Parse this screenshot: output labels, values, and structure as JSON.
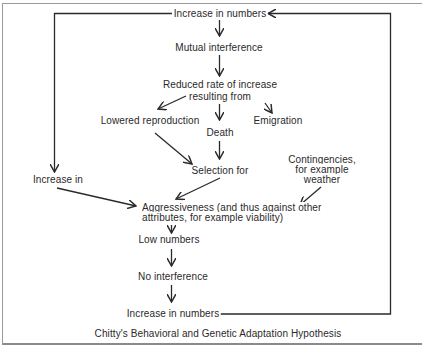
{
  "diagram": {
    "title": "Chitty's Behavioral and Genetic Adaptation Hypothesis",
    "nodes": {
      "top_increase": "Increase in numbers",
      "mutual_interference": "Mutual interference",
      "reduced_rate_line1": "Reduced rate of increase",
      "reduced_rate_line2": "resulting from",
      "lowered_reproduction": "Lowered reproduction",
      "death": "Death",
      "emigration": "Emigration",
      "selection_for": "Selection for",
      "increase_in": "Increase in",
      "contingencies_line1": "Contingencies,",
      "contingencies_line2": "for example",
      "contingencies_line3": "weather",
      "aggressiveness_line1": "Aggressiveness (and thus against other",
      "aggressiveness_line2": "attributes, for example viability)",
      "low_numbers": "Low numbers",
      "no_interference": "No interference",
      "bottom_increase": "Increase in numbers"
    },
    "edges": [
      {
        "from": "top_increase",
        "to": "mutual_interference"
      },
      {
        "from": "mutual_interference",
        "to": "reduced_rate"
      },
      {
        "from": "reduced_rate",
        "to": "lowered_reproduction"
      },
      {
        "from": "reduced_rate",
        "to": "death"
      },
      {
        "from": "reduced_rate",
        "to": "emigration"
      },
      {
        "from": "lowered_reproduction",
        "to": "selection_for"
      },
      {
        "from": "death",
        "to": "selection_for"
      },
      {
        "from": "top_increase",
        "to": "increase_in"
      },
      {
        "from": "increase_in",
        "to": "aggressiveness"
      },
      {
        "from": "selection_for",
        "to": "aggressiveness"
      },
      {
        "from": "contingencies",
        "to": "aggressiveness"
      },
      {
        "from": "aggressiveness",
        "to": "low_numbers"
      },
      {
        "from": "low_numbers",
        "to": "no_interference"
      },
      {
        "from": "no_interference",
        "to": "bottom_increase"
      },
      {
        "from": "bottom_increase",
        "to": "top_increase"
      }
    ],
    "colors": {
      "line": "#2a2a2a",
      "frame": "#9a9a9a",
      "background": "#ffffff"
    }
  }
}
